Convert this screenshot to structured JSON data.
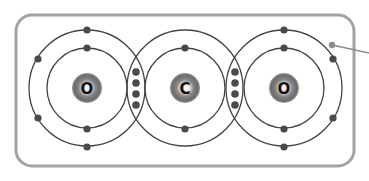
{
  "diagram": {
    "colors": {
      "frame": "#a3a3a3",
      "shell": "#444444",
      "electron": "#4a4a4a",
      "nucleus_outer": "#6e6e6e",
      "nucleus_inner": "#ffffff",
      "label_dot": "#8a8a8a"
    },
    "atoms": [
      {
        "symbol": "O",
        "name": "oxygen-left",
        "cx": 87,
        "cy": 88
      },
      {
        "symbol": "C",
        "name": "carbon-center",
        "cx": 185,
        "cy": 88
      },
      {
        "symbol": "O",
        "name": "oxygen-right",
        "cx": 284,
        "cy": 88
      }
    ],
    "shells": {
      "inner_radius": 40,
      "outer_radius": 58
    },
    "bonds": [
      {
        "type": "double covalent",
        "shared_electrons": 4,
        "x": 136
      },
      {
        "type": "double covalent",
        "shared_electrons": 4,
        "x": 235
      }
    ],
    "pointer": {
      "label": ""
    }
  }
}
